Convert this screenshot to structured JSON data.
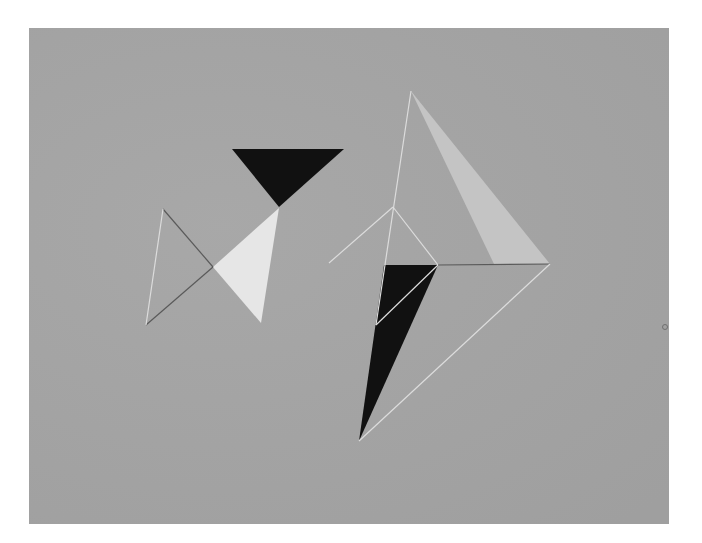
{
  "artwork": {
    "background_color": "#a5a5a5",
    "colors": {
      "black": "#111111",
      "white": "#e6e6e6",
      "light": "#c4c4c4",
      "line_light": "#dcdcdc",
      "line_dark": "#5a5a5a"
    },
    "left_figure": {
      "black_triangle": [
        [
          232,
          149
        ],
        [
          344,
          149
        ],
        [
          279,
          207
        ]
      ],
      "white_triangle": [
        [
          213,
          267
        ],
        [
          279,
          208
        ],
        [
          261,
          323
        ]
      ],
      "lines": [
        {
          "from": [
            163,
            209
          ],
          "to": [
            213,
            267
          ],
          "tone": "dark"
        },
        {
          "from": [
            146,
            325
          ],
          "to": [
            213,
            267
          ],
          "tone": "dark"
        },
        {
          "from": [
            163,
            209
          ],
          "to": [
            146,
            325
          ],
          "tone": "light"
        }
      ]
    },
    "right_figure": {
      "light_triangle": [
        [
          411,
          91
        ],
        [
          494,
          264
        ],
        [
          550,
          264
        ]
      ],
      "black_quad": [
        [
          384,
          265
        ],
        [
          438,
          265
        ],
        [
          359,
          441
        ]
      ],
      "lines": [
        {
          "from": [
            411,
            91
          ],
          "to": [
            376,
            325
          ],
          "tone": "light"
        },
        {
          "from": [
            393,
            207
          ],
          "to": [
            329,
            263
          ],
          "tone": "light"
        },
        {
          "from": [
            393,
            207
          ],
          "to": [
            438,
            265
          ],
          "tone": "light"
        },
        {
          "from": [
            438,
            265
          ],
          "to": [
            376,
            325
          ],
          "tone": "light"
        },
        {
          "from": [
            438,
            265
          ],
          "to": [
            550,
            264
          ],
          "tone": "dark"
        },
        {
          "from": [
            550,
            264
          ],
          "to": [
            359,
            441
          ],
          "tone": "light"
        }
      ]
    },
    "mark": {
      "x": 665,
      "y": 327
    }
  }
}
